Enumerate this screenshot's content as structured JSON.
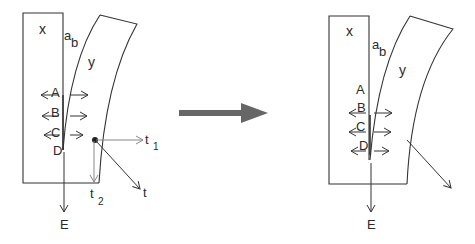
{
  "diagram": {
    "left_panel": {
      "block_label": "x",
      "curved_label": "y",
      "point_a": "a",
      "point_b": "b",
      "arrow_labels": [
        "A",
        "B",
        "C",
        "D"
      ],
      "downward_label": "E",
      "vector_t1_label": "t",
      "vector_t1_sub": "1",
      "vector_t2_label": "t",
      "vector_t2_sub": "2",
      "vector_t_label": "t"
    },
    "transition_arrow": {
      "color": "#666666"
    },
    "right_panel": {
      "block_label": "x",
      "curved_label": "y",
      "point_a": "a",
      "point_b": "b",
      "arrow_labels": [
        "A",
        "B",
        "C",
        "D"
      ],
      "downward_label": "E"
    },
    "colors": {
      "line": "#333333",
      "vector_gray": "#808080",
      "arrow_fill": "#666666"
    }
  }
}
